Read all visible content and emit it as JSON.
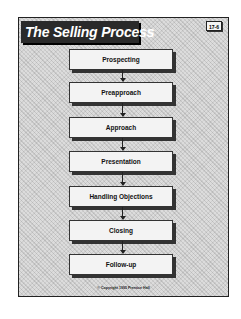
{
  "slide": {
    "title": "The Selling Process",
    "badge": "17-6",
    "copyright": "© Copyright 1995 Prentice Hall"
  },
  "steps": [
    {
      "label": "Prospecting"
    },
    {
      "label": "Preapproach"
    },
    {
      "label": "Approach"
    },
    {
      "label": "Presentation"
    },
    {
      "label": "Handling Objections"
    },
    {
      "label": "Closing"
    },
    {
      "label": "Follow-up"
    }
  ],
  "colors": {
    "background": "#dcdcdc",
    "title_bar": "#2a2a2a",
    "box_fill": "#f3f3f3",
    "ink": "#222222"
  }
}
